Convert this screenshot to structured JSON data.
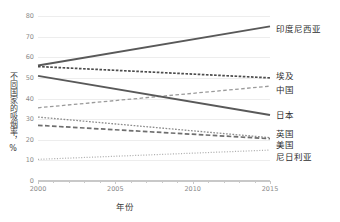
{
  "chart_data": {
    "type": "line",
    "title": "",
    "xlabel": "年份",
    "ylabel": "不同国家的吸烟率，%",
    "x": [
      2000,
      2015
    ],
    "xlim": [
      2000,
      2015
    ],
    "ylim": [
      0,
      80
    ],
    "xticks": [
      "2000",
      "2005",
      "2010",
      "2015"
    ],
    "yticks": [
      "0",
      "10",
      "20",
      "30",
      "40",
      "50",
      "60",
      "70",
      "80"
    ],
    "grid": "horizontal",
    "legend_position": "right-direct-labels",
    "series": [
      {
        "name": "印度尼西亚",
        "values": [
          56.0,
          75.0
        ],
        "style": "solid",
        "color": "#595959",
        "width": 1.9
      },
      {
        "name": "埃及",
        "values": [
          55.5,
          50.0
        ],
        "style": "dense-dash",
        "color": "#4d4d4d",
        "width": 1.7
      },
      {
        "name": "中国",
        "values": [
          35.5,
          46.0
        ],
        "style": "dash",
        "color": "#9a9a9a",
        "width": 1.3
      },
      {
        "name": "日本",
        "values": [
          51.0,
          32.0
        ],
        "style": "solid",
        "color": "#595959",
        "width": 1.9
      },
      {
        "name": "英国",
        "values": [
          31.0,
          21.0
        ],
        "style": "fine-dash",
        "color": "#8c8c8c",
        "width": 1.3
      },
      {
        "name": "美国",
        "values": [
          27.0,
          20.5
        ],
        "style": "long-dash",
        "color": "#6e6e6e",
        "width": 1.7
      },
      {
        "name": "尼日利亚",
        "values": [
          10.5,
          15.0
        ],
        "style": "dot",
        "color": "#b0b0b0",
        "width": 1.2
      }
    ],
    "label_positions": [
      {
        "name": "印度尼西亚",
        "y": 74.0
      },
      {
        "name": "埃及",
        "y": 51.5
      },
      {
        "name": "中国",
        "y": 44.5
      },
      {
        "name": "日本",
        "y": 32.5
      },
      {
        "name": "英国",
        "y": 23.5
      },
      {
        "name": "美国",
        "y": 18.0
      },
      {
        "name": "尼日利亚",
        "y": 12.0
      }
    ]
  }
}
